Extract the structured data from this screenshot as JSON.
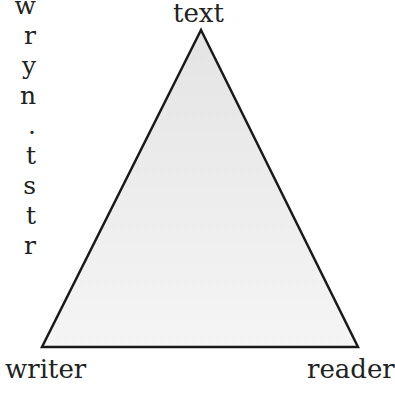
{
  "left_text_fragments": [
    "w",
    "r",
    "y",
    "n",
    ".",
    "t",
    "s",
    "t",
    "r"
  ],
  "diagram": {
    "labels": {
      "top": "text",
      "bottom_left": "writer",
      "bottom_right": "reader"
    },
    "fill_top": "#e6e6e6",
    "fill_bottom": "#f4f4f4",
    "stroke": "#1a1a1a"
  }
}
